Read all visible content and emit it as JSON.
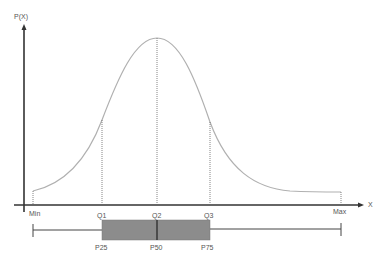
{
  "diagram": {
    "y_axis_label": "P(X)",
    "x_axis_label": "X",
    "markers": {
      "min": "Min",
      "q1": "Q1",
      "q2": "Q2",
      "q3": "Q3",
      "max": "Max"
    },
    "percentiles": {
      "p25": "P25",
      "p50": "P50",
      "p75": "P75"
    },
    "colors": {
      "curve": "#b0b0b0",
      "axis": "#333333",
      "box_fill": "#8c8c8c",
      "whisker": "#444444"
    }
  }
}
